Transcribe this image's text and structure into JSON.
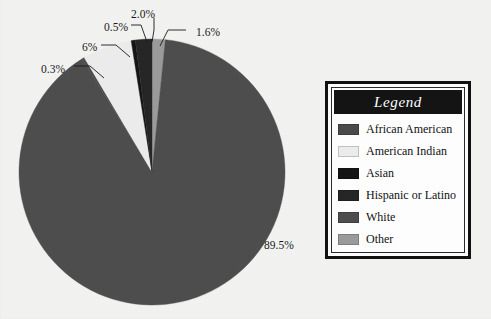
{
  "background_color": "#f1f1f0",
  "legend": {
    "title": "Legend",
    "title_color": "#ffffff",
    "title_bar_color": "#141414",
    "items": [
      {
        "label": "African American",
        "color": "#4a4a4a"
      },
      {
        "label": "American Indian",
        "color": "#ebebeb"
      },
      {
        "label": "Asian",
        "color": "#151515"
      },
      {
        "label": "Hispanic or Latino",
        "color": "#262626"
      },
      {
        "label": "White",
        "color": "#4d4d4d"
      },
      {
        "label": "Other",
        "color": "#9a9a9a"
      }
    ]
  },
  "chart_data": {
    "type": "pie",
    "title": "",
    "legend_position": "right",
    "center": {
      "x": 152,
      "y": 172
    },
    "radius": 133,
    "start_angle_deg": -90,
    "direction": "clockwise",
    "categories": [
      "Other",
      "White",
      "African American",
      "American Indian",
      "Asian",
      "Hispanic or Latino"
    ],
    "slices": [
      {
        "name": "Other",
        "value": 1.6,
        "label": "1.6%",
        "color": "#9a9a9a",
        "label_x": 196,
        "label_y": 33,
        "leader": [
          [
            186,
            30
          ],
          [
            168,
            30
          ],
          [
            160,
            46
          ]
        ]
      },
      {
        "name": "White",
        "value": 89.5,
        "label": "89.5%",
        "color": "#4d4d4d",
        "label_x": 264,
        "label_y": 246,
        "leader": []
      },
      {
        "name": "African American",
        "value": 0.3,
        "label": "0.3%",
        "color": "#4a4a4a",
        "label_x": 41,
        "label_y": 70,
        "leader": [
          [
            74,
            66
          ],
          [
            90,
            66
          ],
          [
            104,
            78
          ]
        ]
      },
      {
        "name": "American Indian",
        "value": 6.0,
        "label": "6%",
        "color": "#ebebeb",
        "label_x": 82,
        "label_y": 48,
        "leader": [
          [
            101,
            45
          ],
          [
            116,
            45
          ],
          [
            130,
            57
          ]
        ]
      },
      {
        "name": "Asian",
        "value": 0.5,
        "label": "0.5%",
        "color": "#151515",
        "label_x": 104,
        "label_y": 28,
        "leader": [
          [
            131,
            25
          ],
          [
            141,
            25
          ],
          [
            147,
            42
          ]
        ]
      },
      {
        "name": "Hispanic or Latino",
        "value": 2.0,
        "label": "2.0%",
        "color": "#262626",
        "label_x": 131,
        "label_y": 15,
        "leader": [
          [
            154,
            18
          ],
          [
            154,
            30
          ],
          [
            152,
            42
          ]
        ]
      }
    ],
    "total": 99.9,
    "units": "percent"
  }
}
